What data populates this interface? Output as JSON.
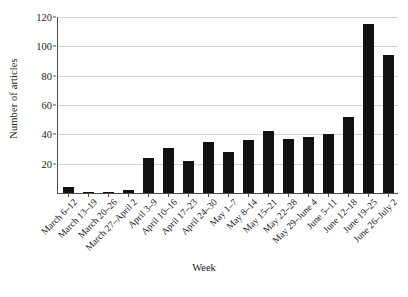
{
  "chart_data": {
    "type": "bar",
    "title": "",
    "xlabel": "Week",
    "ylabel": "Number of articles",
    "ylim": [
      0,
      120
    ],
    "yticks": [
      0,
      20,
      40,
      60,
      80,
      100,
      120
    ],
    "ytick_labels": [
      "",
      "20",
      "40",
      "60",
      "80",
      "100",
      "120"
    ],
    "grid": true,
    "legend": false,
    "bar_color": "#111111",
    "grid_color": "#d2d2d2",
    "axis_color": "#4d4d4d",
    "categories": [
      "March 6–12",
      "March 13–19",
      "March 20–26",
      "March 27–April 2",
      "April 3–9",
      "April 10–16",
      "April 17–23",
      "April 24–30",
      "May 1–7",
      "May 8–14",
      "May 15–21",
      "May 22–28",
      "May 29–June 4",
      "June 5–11",
      "June 12–18",
      "June 19–25",
      "June 26–July 2"
    ],
    "values": [
      4,
      1,
      1,
      2,
      24,
      31,
      22,
      35,
      28,
      36,
      42,
      37,
      38,
      40,
      52,
      115,
      94
    ]
  },
  "axis": {
    "y_title": "Number of articles",
    "x_title": "Week"
  },
  "caption": ""
}
